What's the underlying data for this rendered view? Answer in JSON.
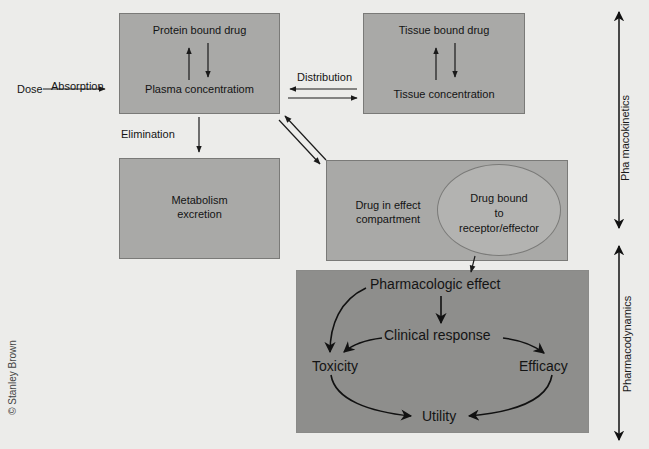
{
  "diagram": {
    "dose": "Dose",
    "absorption": "Absorption",
    "plasma_box": {
      "top": "Protein bound drug",
      "bottom": "Plasma concentratiom"
    },
    "distribution": "Distribution",
    "tissue_box": {
      "top": "Tissue bound drug",
      "bottom": "Tissue concentration"
    },
    "elimination": "Elimination",
    "metabolism_box": {
      "line1": "Metabolism",
      "line2": "excretion"
    },
    "effect_box": {
      "line1": "Drug in effect",
      "line2": "compartment"
    },
    "receptor_ellipse": {
      "line1": "Drug bound",
      "line2": "to",
      "line3": "receptor/effector"
    },
    "pd_box": {
      "pharmacologic_effect": "Pharmacologic effect",
      "clinical_response": "Clinical response",
      "toxicity": "Toxicity",
      "efficacy": "Efficacy",
      "utility": "Utility"
    },
    "side_labels": {
      "pharmacokinetics": "Pha macokinetics",
      "pharmacodynamics": "Pharmacodynamics"
    },
    "copyright": "© Stanley Brown"
  },
  "colors": {
    "background": "#ececea",
    "box": "#a9a9a7",
    "pd_box": "#8e8e8c",
    "ellipse": "#b3b3b1",
    "line": "#1a1a1a"
  }
}
